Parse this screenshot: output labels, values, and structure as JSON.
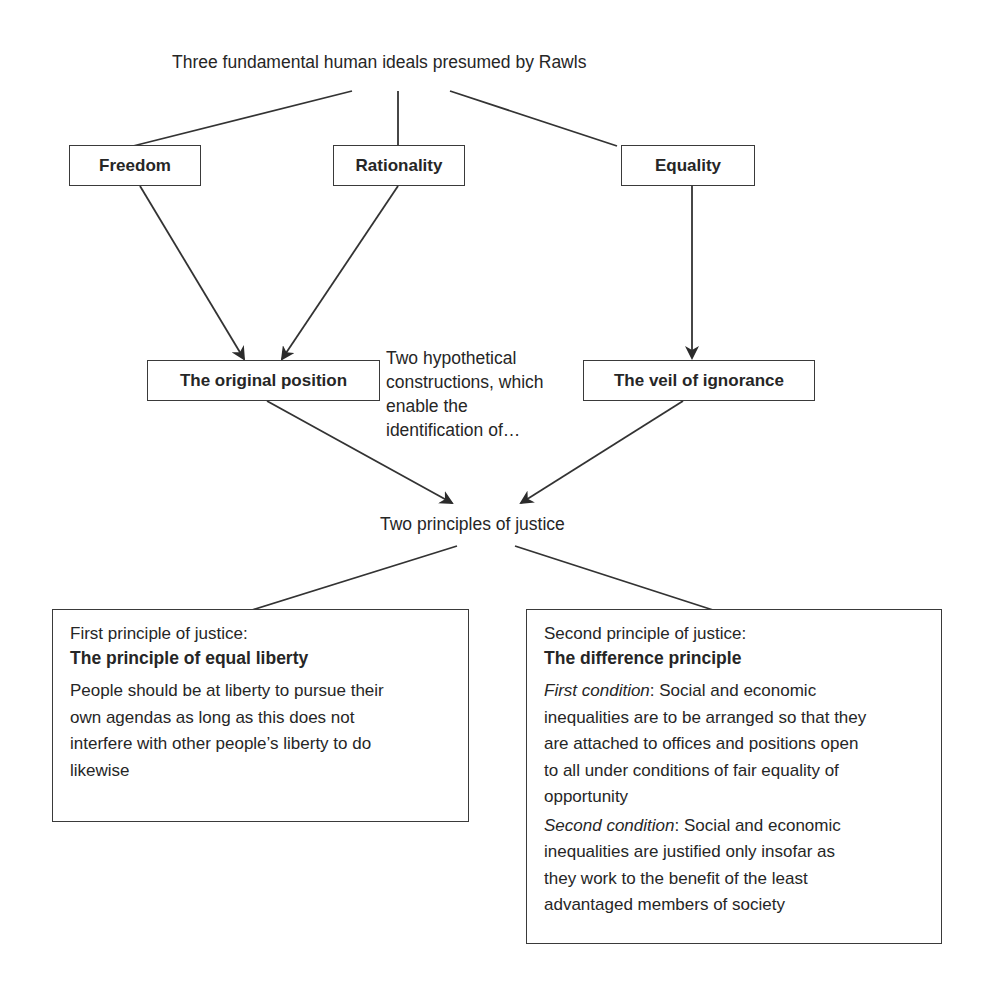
{
  "diagram": {
    "title": "Three fundamental human ideals presumed by Rawls",
    "ideals": [
      {
        "label": "Freedom"
      },
      {
        "label": "Rationality"
      },
      {
        "label": "Equality"
      }
    ],
    "constructions": {
      "original_position": "The original position",
      "veil_of_ignorance": "The veil of ignorance",
      "note_lines": [
        "Two hypothetical",
        "constructions, which",
        "enable the",
        "identification of…"
      ]
    },
    "principles_label": "Two principles of justice",
    "first_principle": {
      "subtitle": "First principle of justice:",
      "heading": "The principle of equal liberty",
      "body_lines": [
        "People should be at liberty to pursue their",
        "own agendas as long as this does not",
        "interfere with other people’s liberty to do",
        "likewise"
      ]
    },
    "second_principle": {
      "subtitle": "Second principle of justice:",
      "heading": "The difference principle",
      "conditions": [
        {
          "label": "First condition",
          "first_line_rest": ": Social and economic",
          "lines": [
            "inequalities are to be arranged so that they",
            "are  attached to offices and positions open",
            "to all under conditions of fair equality of",
            "opportunity"
          ]
        },
        {
          "label": "Second condition",
          "first_line_rest": ": Social and economic",
          "lines": [
            "inequalities are justified only insofar as",
            "they work to the benefit of the least",
            "advantaged members of society"
          ]
        }
      ]
    },
    "colors": {
      "line": "#333333",
      "text": "#262626",
      "background": "#ffffff"
    }
  }
}
